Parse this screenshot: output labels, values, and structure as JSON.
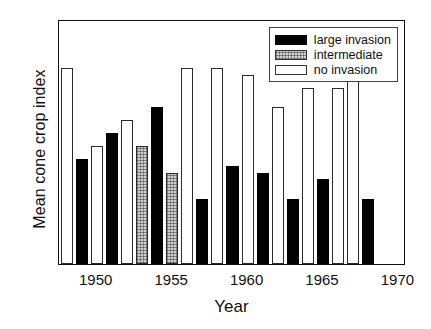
{
  "chart_data": {
    "type": "bar",
    "title": "",
    "xlabel": "Year",
    "ylabel": "Mean cone crop index",
    "xlim": [
      1947.5,
      1970.5
    ],
    "ylim": [
      0,
      3.75
    ],
    "yticks": [
      0,
      1,
      2,
      3
    ],
    "ytick_labels": [
      "0",
      "1",
      "2",
      "3"
    ],
    "xticks": [
      1950,
      1955,
      1960,
      1965,
      1970
    ],
    "xtick_labels": [
      "1950",
      "1955",
      "1960",
      "1965",
      "1970"
    ],
    "grid": false,
    "legend_position": "top-right",
    "categories": [
      1948,
      1949,
      1950,
      1951,
      1952,
      1953,
      1954,
      1955,
      1956,
      1957,
      1958,
      1959,
      1960,
      1961,
      1962,
      1963,
      1964,
      1965,
      1966,
      1967,
      1968
    ],
    "series": [
      {
        "name": "large invasion",
        "key": "large",
        "color": "#000000",
        "values": [
          null,
          1.6,
          null,
          2.0,
          null,
          null,
          2.4,
          null,
          null,
          1.0,
          null,
          1.5,
          null,
          1.4,
          null,
          1.0,
          null,
          1.3,
          null,
          null,
          1.0
        ]
      },
      {
        "name": "intermediate",
        "key": "inter",
        "color": "#cfcfcf",
        "values": [
          null,
          null,
          null,
          null,
          null,
          1.8,
          null,
          1.4,
          null,
          null,
          null,
          null,
          null,
          null,
          null,
          null,
          null,
          null,
          null,
          null,
          null
        ]
      },
      {
        "name": "no invasion",
        "key": "none",
        "color": "#ffffff",
        "values": [
          3.0,
          null,
          1.8,
          null,
          2.2,
          null,
          null,
          null,
          3.0,
          null,
          3.0,
          null,
          2.9,
          null,
          2.4,
          null,
          2.7,
          null,
          2.7,
          3.0,
          null
        ]
      }
    ],
    "bars": [
      {
        "year": 1948,
        "value": 3.0,
        "category": "no invasion",
        "key": "none"
      },
      {
        "year": 1949,
        "value": 1.6,
        "category": "large invasion",
        "key": "large"
      },
      {
        "year": 1950,
        "value": 1.8,
        "category": "no invasion",
        "key": "none"
      },
      {
        "year": 1951,
        "value": 2.0,
        "category": "large invasion",
        "key": "large"
      },
      {
        "year": 1952,
        "value": 2.2,
        "category": "no invasion",
        "key": "none"
      },
      {
        "year": 1953,
        "value": 1.8,
        "category": "intermediate",
        "key": "inter"
      },
      {
        "year": 1954,
        "value": 2.4,
        "category": "large invasion",
        "key": "large"
      },
      {
        "year": 1955,
        "value": 1.4,
        "category": "intermediate",
        "key": "inter"
      },
      {
        "year": 1956,
        "value": 3.0,
        "category": "no invasion",
        "key": "none"
      },
      {
        "year": 1957,
        "value": 1.0,
        "category": "large invasion",
        "key": "large"
      },
      {
        "year": 1958,
        "value": 3.0,
        "category": "no invasion",
        "key": "none"
      },
      {
        "year": 1959,
        "value": 1.5,
        "category": "large invasion",
        "key": "large"
      },
      {
        "year": 1960,
        "value": 2.9,
        "category": "no invasion",
        "key": "none"
      },
      {
        "year": 1961,
        "value": 1.4,
        "category": "large invasion",
        "key": "large"
      },
      {
        "year": 1962,
        "value": 2.4,
        "category": "no invasion",
        "key": "none"
      },
      {
        "year": 1963,
        "value": 1.0,
        "category": "large invasion",
        "key": "large"
      },
      {
        "year": 1964,
        "value": 2.7,
        "category": "no invasion",
        "key": "none"
      },
      {
        "year": 1965,
        "value": 1.3,
        "category": "large invasion",
        "key": "large"
      },
      {
        "year": 1966,
        "value": 2.7,
        "category": "no invasion",
        "key": "none"
      },
      {
        "year": 1967,
        "value": 3.0,
        "category": "no invasion",
        "key": "none"
      },
      {
        "year": 1968,
        "value": 1.0,
        "category": "large invasion",
        "key": "large"
      }
    ],
    "legend": [
      {
        "label": "large invasion",
        "key": "large"
      },
      {
        "label": "intermediate",
        "key": "inter"
      },
      {
        "label": "no invasion",
        "key": "none"
      }
    ]
  }
}
